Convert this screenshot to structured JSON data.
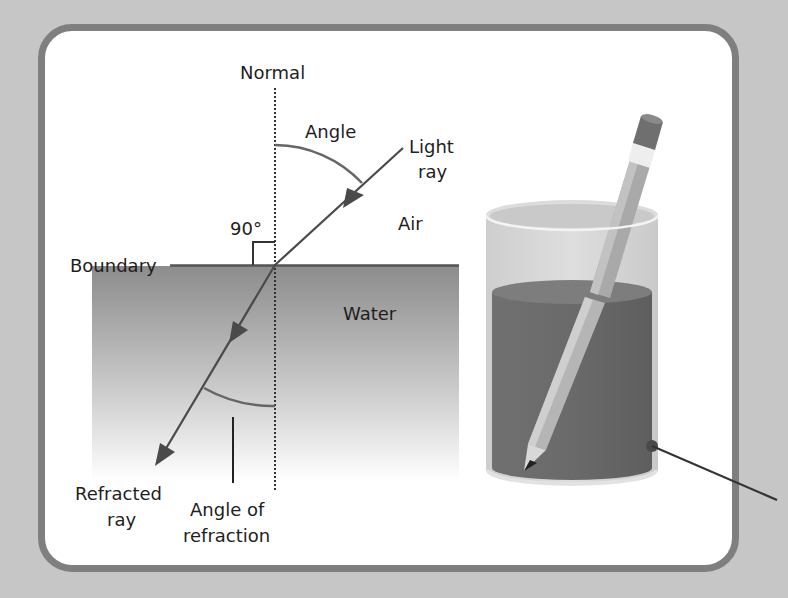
{
  "diagram": {
    "labels": {
      "normal": "Normal",
      "angle": "Angle",
      "light_ray_line1": "Light",
      "light_ray_line2": "ray",
      "air": "Air",
      "right_angle": "90°",
      "boundary": "Boundary",
      "water": "Water",
      "refracted_line1": "Refracted",
      "refracted_line2": "ray",
      "angle_refraction_line1": "Angle of",
      "angle_refraction_line2": "refraction"
    },
    "colors": {
      "background": "#c6c6c6",
      "card_border": "#7f7f7f",
      "water_top": "#8f8f8f",
      "ray": "#555555",
      "glass_water": "#707070"
    },
    "illustration": {
      "subject": "pencil in glass of water",
      "elements": [
        "glass",
        "water",
        "pencil",
        "leader-line"
      ]
    }
  }
}
